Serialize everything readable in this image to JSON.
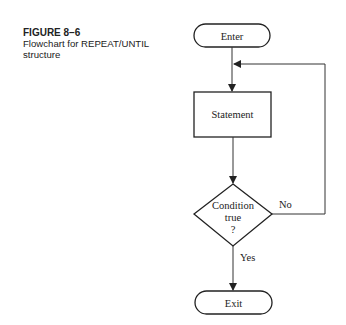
{
  "caption": {
    "figure_number": "FIGURE 8–6",
    "title_line1": "Flowchart for REPEAT/UNTIL",
    "title_line2": "structure"
  },
  "flowchart": {
    "nodes": {
      "enter": "Enter",
      "statement": "Statement",
      "condition_line1": "Condition",
      "condition_line2": "true",
      "condition_line3": "?",
      "exit": "Exit"
    },
    "edge_labels": {
      "no": "No",
      "yes": "Yes"
    }
  }
}
